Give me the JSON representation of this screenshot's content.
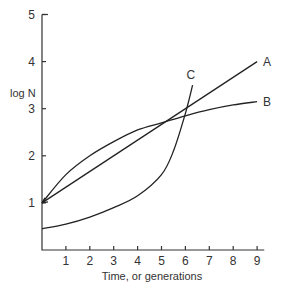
{
  "chart_data": {
    "type": "line",
    "title": "",
    "xlabel": "Time, or generations",
    "ylabel": "log N",
    "xlim": [
      0,
      9.5
    ],
    "ylim": [
      0,
      5
    ],
    "x_ticks": [
      "1",
      "2",
      "3",
      "4",
      "5",
      "6",
      "7",
      "8",
      "9"
    ],
    "y_ticks": [
      "1",
      "2",
      "3",
      "4",
      "5"
    ],
    "grid": false,
    "legend": "inline labels at curve ends",
    "series": [
      {
        "name": "A",
        "x": [
          0,
          3,
          6,
          9
        ],
        "values": [
          1.0,
          2.0,
          3.0,
          4.0
        ]
      },
      {
        "name": "B",
        "x": [
          0,
          1,
          2,
          3,
          4,
          5,
          6,
          7,
          8,
          9
        ],
        "values": [
          1.0,
          1.6,
          2.0,
          2.3,
          2.55,
          2.7,
          2.85,
          2.98,
          3.08,
          3.15
        ]
      },
      {
        "name": "C",
        "x": [
          0,
          1,
          2,
          3,
          4,
          5,
          5.5,
          6,
          6.3
        ],
        "values": [
          0.45,
          0.55,
          0.7,
          0.9,
          1.15,
          1.6,
          2.1,
          2.9,
          3.5
        ]
      }
    ]
  }
}
